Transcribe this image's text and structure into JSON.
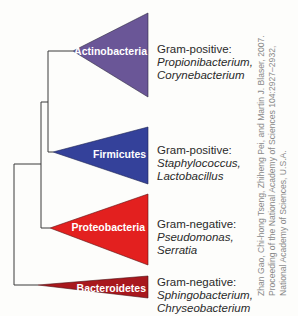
{
  "figure": {
    "clades": [
      {
        "name": "Actinobacteria",
        "color": "#6a5697",
        "gram": "Gram-positive:",
        "examples": [
          "Propionibacterium,",
          "Corynebacterium"
        ]
      },
      {
        "name": "Firmicutes",
        "color": "#34419a",
        "gram": "Gram-positive:",
        "examples": [
          "Staphylococcus,",
          "Lactobacillus"
        ]
      },
      {
        "name": "Proteobacteria",
        "color": "#e3201f",
        "gram": "Gram-negative:",
        "examples": [
          "Pseudomonas,",
          "Serratia"
        ]
      },
      {
        "name": "Bacteroidetes",
        "color": "#a8181d",
        "gram": "Gram-negative:",
        "examples": [
          "Sphingobacterium,",
          "Chryseobacterium"
        ]
      }
    ],
    "credit": [
      "Zhan Gao, Chi-hong Tseng, Zhiheng Pei, and Martin J. Blaser, 2007.",
      "Proceeding of the National Academy of Sciences 104:2927–2932,",
      "National Academy of Sciences, U.S.A."
    ]
  }
}
